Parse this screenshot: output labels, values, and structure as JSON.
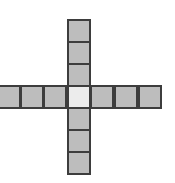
{
  "diagram": {
    "type": "plus-grid",
    "colors": {
      "cell_fill": "#bdbdbd",
      "center_fill": "#ececec",
      "border": "#3d3d3d",
      "background": "#ffffff"
    },
    "arms": {
      "up": 3,
      "down": 3,
      "left": 3,
      "right": 3
    },
    "cells": [
      {
        "id": "up-3",
        "x": 67,
        "y": 19,
        "role": "arm"
      },
      {
        "id": "up-2",
        "x": 67,
        "y": 41,
        "role": "arm"
      },
      {
        "id": "up-1",
        "x": 67,
        "y": 63,
        "role": "arm"
      },
      {
        "id": "left-3",
        "x": -3,
        "y": 85,
        "role": "arm"
      },
      {
        "id": "left-2",
        "x": 20,
        "y": 85,
        "role": "arm"
      },
      {
        "id": "left-1",
        "x": 43,
        "y": 85,
        "role": "arm"
      },
      {
        "id": "center",
        "x": 67,
        "y": 85,
        "role": "center"
      },
      {
        "id": "right-1",
        "x": 90,
        "y": 85,
        "role": "arm"
      },
      {
        "id": "right-2",
        "x": 114,
        "y": 85,
        "role": "arm"
      },
      {
        "id": "right-3",
        "x": 138,
        "y": 85,
        "role": "arm"
      },
      {
        "id": "down-1",
        "x": 67,
        "y": 107,
        "role": "arm"
      },
      {
        "id": "down-2",
        "x": 67,
        "y": 129,
        "role": "arm"
      },
      {
        "id": "down-3",
        "x": 67,
        "y": 151,
        "role": "arm"
      }
    ]
  }
}
